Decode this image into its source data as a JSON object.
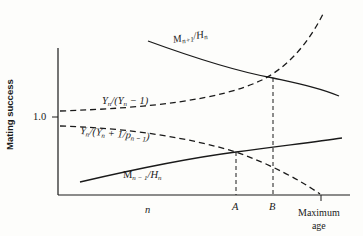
{
  "diagram": {
    "y_axis_label": "Mating success",
    "y_tick_label": "1.0",
    "x_tick_labels": {
      "n": "n",
      "A": "A",
      "B": "B",
      "max_line1": "Maximum",
      "max_line2": "age"
    },
    "curves": {
      "m_plus": {
        "base": "M",
        "sub": "n+1",
        "rest": "/H",
        "sub2": "n",
        "style": "solid"
      },
      "y_ratio": {
        "base": "Y",
        "sub": "n",
        "rest": "/(Y",
        "sub2": "n",
        "tail": " − 1)",
        "style": "dashed"
      },
      "y_p_ratio": {
        "base": "Y",
        "sub": "n",
        "rest": "/(Y",
        "sub2": "n",
        "mid": " + 1/p",
        "sub3": "n − 1",
        "tail": ")",
        "style": "dashed"
      },
      "m_minus": {
        "base": "M",
        "sub": "n − 1",
        "rest": "/H",
        "sub2": "n",
        "style": "solid"
      }
    },
    "colors": {
      "ink": "#1a1a1a",
      "background": "#fdfdfb"
    }
  }
}
